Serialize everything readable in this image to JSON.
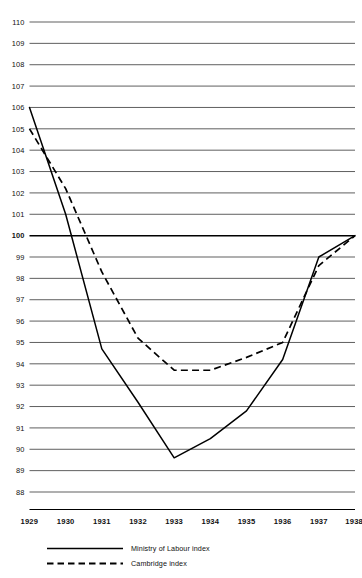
{
  "chart_data": {
    "type": "line",
    "title": "",
    "subtitle": "",
    "xlabel": "",
    "ylabel": "",
    "x": [
      1929,
      1930,
      1931,
      1932,
      1933,
      1934,
      1935,
      1936,
      1937,
      1938
    ],
    "categories": [
      "1929",
      "1930",
      "1931",
      "1932",
      "1933",
      "1934",
      "1935",
      "1936",
      "1937",
      "1938"
    ],
    "xlim": [
      1929,
      1938
    ],
    "ylim": [
      88,
      110
    ],
    "y_ticks": [
      110,
      109,
      108,
      107,
      106,
      105,
      104,
      103,
      102,
      101,
      100,
      99,
      98,
      97,
      96,
      95,
      94,
      93,
      92,
      91,
      90,
      89,
      88
    ],
    "y_tick_labels": [
      "110",
      "109",
      "108",
      "107",
      "106",
      "105",
      "104",
      "103",
      "102",
      "101",
      "100",
      "99",
      "98",
      "97",
      "96",
      "95",
      "94",
      "93",
      "92",
      "91",
      "90",
      "89",
      "88"
    ],
    "emphasis_gridline": 100,
    "grid": true,
    "grid_orientation": "horizontal",
    "legend_position": "bottom-left",
    "series": [
      {
        "name": "Ministry of Labour index",
        "style": "solid",
        "color": "#000000",
        "values": [
          106.0,
          101.0,
          94.7,
          92.2,
          89.6,
          90.5,
          91.8,
          94.2,
          99.0,
          100.0
        ]
      },
      {
        "name": "Cambridge index",
        "style": "dashed",
        "color": "#000000",
        "values": [
          105.0,
          102.2,
          98.3,
          95.2,
          93.7,
          93.7,
          94.3,
          95.0,
          98.6,
          100.0
        ]
      }
    ]
  },
  "legend": {
    "items": [
      {
        "label": "Ministry of Labour index",
        "style": "solid"
      },
      {
        "label": "Cambridge index",
        "style": "dashed"
      }
    ]
  }
}
